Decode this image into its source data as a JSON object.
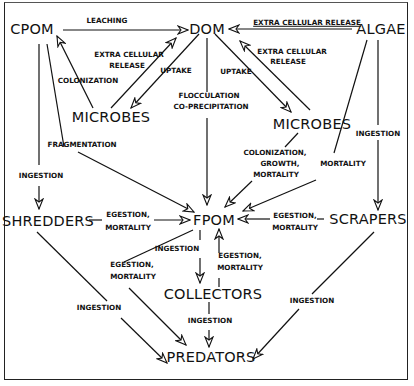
{
  "diagram": {
    "type": "flow-diagram",
    "nodes": {
      "cpom": "CPOM",
      "dom": "DOM",
      "algae": "ALGAE",
      "microbes_left": "MICROBES",
      "microbes_right": "MICROBES",
      "shredders": "SHREDDERS",
      "fpom": "FPOM",
      "scrapers": "SCRAPERS",
      "collectors": "COLLECTORS",
      "predators": "PREDATORS"
    },
    "labels": {
      "leaching": "LEACHING",
      "extra_cellular_release_top": "EXTRA CELLULAR RELEASE",
      "extra_cellular_release_left_1": "EXTRA CELLULAR",
      "extra_cellular_release_left_2": "RELEASE",
      "extra_cellular_release_right_1": "EXTRA CELLULAR",
      "extra_cellular_release_right_2": "RELEASE",
      "uptake_left": "UPTAKE",
      "uptake_right": "UPTAKE",
      "colonization": "COLONIZATION",
      "flocculation_1": "FLOCCULATION",
      "flocculation_2": "CO-PRECIPITATION",
      "fragmentation": "FRAGMENTATION",
      "ingestion_cpom_shredders": "INGESTION",
      "ingestion_algae_scrapers": "INGESTION",
      "colonization_growth_mortality_1": "COLONIZATION,",
      "colonization_growth_mortality_2": "GROWTH,",
      "colonization_growth_mortality_3": "MORTALITY",
      "mortality_algae": "MORTALITY",
      "egestion_shredders_1": "EGESTION,",
      "egestion_shredders_2": "MORTALITY",
      "egestion_scrapers_1": "EGESTION,",
      "egestion_scrapers_2": "MORTALITY",
      "ingestion_fpom_collectors": "INGESTION",
      "egestion_collectors_1": "EGESTION,",
      "egestion_collectors_2": "MORTALITY",
      "egestion_fpom_predators_1": "EGESTION,",
      "egestion_fpom_predators_2": "MORTALITY",
      "ingestion_shredders_predators": "INGESTION",
      "ingestion_collectors_predators": "INGESTION",
      "ingestion_scrapers_predators": "INGESTION"
    },
    "edges": [
      {
        "from": "CPOM",
        "to": "DOM",
        "label": "LEACHING"
      },
      {
        "from": "ALGAE",
        "to": "DOM",
        "label": "EXTRA CELLULAR RELEASE"
      },
      {
        "from": "MICROBES (left)",
        "to": "DOM",
        "label": "EXTRA CELLULAR RELEASE"
      },
      {
        "from": "DOM",
        "to": "MICROBES (left)",
        "label": "UPTAKE"
      },
      {
        "from": "MICROBES (left)",
        "to": "CPOM",
        "label": "COLONIZATION"
      },
      {
        "from": "DOM",
        "to": "MICROBES (right)",
        "label": "UPTAKE"
      },
      {
        "from": "MICROBES (right)",
        "to": "DOM",
        "label": "EXTRA CELLULAR RELEASE"
      },
      {
        "from": "DOM",
        "to": "FPOM",
        "label": "FLOCCULATION CO-PRECIPITATION"
      },
      {
        "from": "CPOM",
        "to": "FPOM",
        "label": "FRAGMENTATION"
      },
      {
        "from": "CPOM",
        "to": "SHREDDERS",
        "label": "INGESTION"
      },
      {
        "from": "MICROBES (right)",
        "to": "FPOM",
        "label": "COLONIZATION, GROWTH, MORTALITY"
      },
      {
        "from": "ALGAE",
        "to": "FPOM",
        "label": "MORTALITY"
      },
      {
        "from": "ALGAE",
        "to": "SCRAPERS",
        "label": "INGESTION"
      },
      {
        "from": "SHREDDERS",
        "to": "FPOM",
        "label": "EGESTION, MORTALITY"
      },
      {
        "from": "SCRAPERS",
        "to": "FPOM",
        "label": "EGESTION, MORTALITY"
      },
      {
        "from": "FPOM",
        "to": "COLLECTORS",
        "label": "INGESTION"
      },
      {
        "from": "COLLECTORS",
        "to": "FPOM",
        "label": "EGESTION, MORTALITY"
      },
      {
        "from": "FPOM",
        "to": "PREDATORS",
        "label": "EGESTION, MORTALITY"
      },
      {
        "from": "SHREDDERS",
        "to": "PREDATORS",
        "label": "INGESTION"
      },
      {
        "from": "COLLECTORS",
        "to": "PREDATORS",
        "label": "INGESTION"
      },
      {
        "from": "SCRAPERS",
        "to": "PREDATORS",
        "label": "INGESTION"
      }
    ],
    "colors": {
      "line": "#111111",
      "background": "#ffffff"
    }
  }
}
